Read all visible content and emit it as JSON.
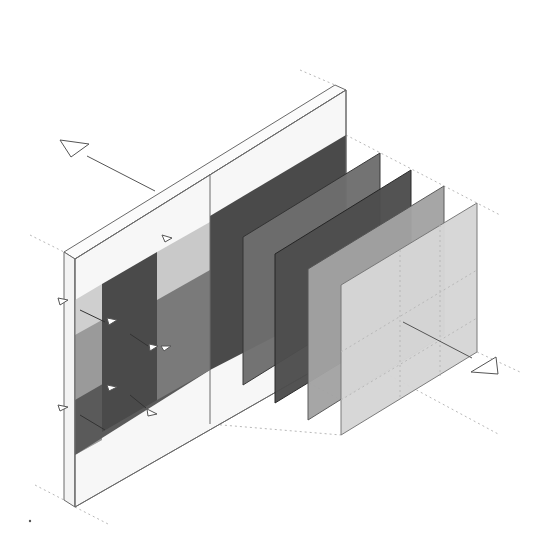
{
  "diagram": {
    "type": "isometric exploded layer diagram",
    "colors": {
      "background": "#ffffff",
      "wall_face": "#f6f6f6",
      "wall_edge": "#6a6a6a",
      "wall_dark_block": "#4a4a4a",
      "wall_mid_block": "#8c8c8c",
      "wall_light_block": "#cfcfcf",
      "panel_1": "#6e6e6e",
      "panel_2": "#4d4d4d",
      "panel_3": "#a3a3a3",
      "panel_4": "#d6d6d6",
      "guide_lines": "#b8b8b8"
    },
    "layers": [
      {
        "name": "base-wall",
        "shade": "white"
      },
      {
        "name": "panel-1",
        "shade": "dark-gray"
      },
      {
        "name": "panel-2",
        "shade": "darker-gray"
      },
      {
        "name": "panel-3",
        "shade": "mid-gray"
      },
      {
        "name": "panel-4",
        "shade": "light-gray"
      }
    ],
    "markers": {
      "arrow_left_label": "",
      "arrow_right_label": ""
    }
  }
}
